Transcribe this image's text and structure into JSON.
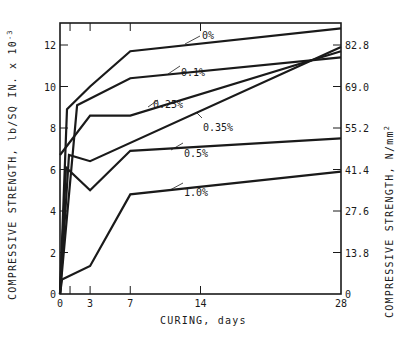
{
  "chart_data": {
    "type": "line",
    "title": "",
    "xlabel": "CURING, days",
    "ylabel": "COMPRESSIVE STRENGTH, lb/SQ IN. x 10",
    "ylabel_exponent": "-3",
    "ylabel_right": "COMPRESSIVE STRENGTH, N/mm",
    "ylabel_right_exponent": "2",
    "xlim": [
      0,
      28
    ],
    "ylim": [
      0,
      13
    ],
    "x_ticks": [
      0,
      3,
      7,
      14,
      28
    ],
    "x_tick_labels": [
      "0",
      "3",
      "7",
      "14",
      "28"
    ],
    "x_minor_ticks": [
      1
    ],
    "y_ticks": [
      0,
      2,
      4,
      6,
      8,
      10,
      12
    ],
    "y_tick_labels": [
      "0",
      "2",
      "4",
      "6",
      "8",
      "10",
      "12"
    ],
    "y_right_ticks": [
      0,
      2,
      4,
      6,
      8,
      10,
      12
    ],
    "y_right_tick_labels": [
      "0",
      "13.8",
      "27.6",
      "41.4",
      "55.2",
      "69.0",
      "82.8"
    ],
    "grid": false,
    "legend": "inline labels",
    "series": [
      {
        "name": "0%",
        "x": [
          0,
          0.7,
          3,
          7,
          28
        ],
        "values": [
          0,
          8.9,
          10.0,
          11.7,
          12.8
        ]
      },
      {
        "name": "0.1%",
        "x": [
          0,
          1.7,
          7,
          28
        ],
        "values": [
          0,
          9.1,
          10.4,
          11.4
        ]
      },
      {
        "name": "0.25%",
        "x": [
          0,
          3,
          7,
          28
        ],
        "values": [
          6.7,
          8.6,
          8.6,
          11.7
        ]
      },
      {
        "name": "0.35%",
        "x": [
          0,
          0.9,
          3,
          28
        ],
        "values": [
          0,
          6.7,
          6.4,
          11.9
        ]
      },
      {
        "name": "0.5%",
        "x": [
          0,
          0.6,
          3,
          7,
          28
        ],
        "values": [
          0,
          6.1,
          5.0,
          6.9,
          7.5
        ]
      },
      {
        "name": "1.0%",
        "x": [
          0,
          0.2,
          3,
          7,
          28
        ],
        "values": [
          0,
          0.7,
          1.35,
          4.8,
          5.9
        ]
      }
    ],
    "annotations": [
      {
        "text": "0%",
        "x": 202,
        "y": 30,
        "leader": [
          [
            185,
            44
          ],
          [
            200,
            36
          ]
        ]
      },
      {
        "text": "0.1%",
        "x": 181,
        "y": 67,
        "leader": [
          [
            168,
            74
          ],
          [
            180,
            66
          ]
        ]
      },
      {
        "text": "0.25%",
        "x": 153,
        "y": 99,
        "leader": [
          [
            148,
            107
          ],
          [
            158,
            100
          ]
        ]
      },
      {
        "text": "0.35%",
        "x": 203,
        "y": 122,
        "leader": [
          [
            197,
            113
          ],
          [
            202,
            118
          ]
        ]
      },
      {
        "text": "0.5%",
        "x": 184,
        "y": 148,
        "leader": [
          [
            171,
            150
          ],
          [
            183,
            143
          ]
        ]
      },
      {
        "text": "1.0%",
        "x": 184,
        "y": 187,
        "leader": [
          [
            170,
            190
          ],
          [
            183,
            183
          ]
        ]
      }
    ]
  },
  "labels": {
    "xlabel": "CURING, days",
    "ylabel_left": "COMPRESSIVE STRENGTH, lb/SQ IN. x 10",
    "ylabel_left_exp": "-3",
    "ylabel_right": "COMPRESSIVE STRENGTH, N/mm",
    "ylabel_right_exp": "2"
  }
}
